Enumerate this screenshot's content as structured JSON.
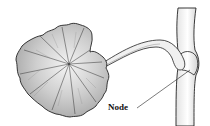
{
  "diagram": {
    "type": "botanical-illustration",
    "labels": [
      {
        "text": "Node",
        "target": "node"
      }
    ],
    "parts": [
      "leaf-blade",
      "petiole",
      "stem",
      "node"
    ],
    "colors": {
      "outline": "#222222",
      "shading": "#9a9a9a",
      "background": "#ffffff"
    }
  }
}
